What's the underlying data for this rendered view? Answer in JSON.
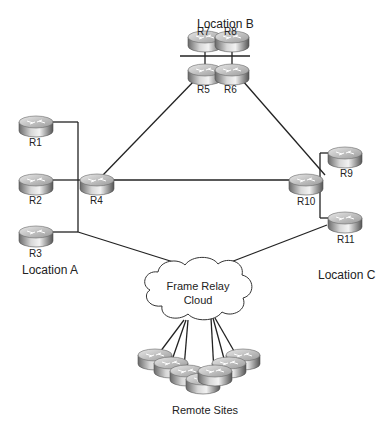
{
  "diagram": {
    "locations": {
      "a": "Location  A",
      "b": "Location  B",
      "c": "Location  C"
    },
    "routers": {
      "r1": "R1",
      "r2": "R2",
      "r3": "R3",
      "r4": "R4",
      "r5": "R5",
      "r6": "R6",
      "r7": "R7",
      "r8": "R8",
      "r9": "R9",
      "r10": "R10",
      "r11": "R11"
    },
    "cloud": {
      "line1": "Frame Relay",
      "line2": "Cloud"
    },
    "remote_sites_label": "Remote Sites"
  }
}
